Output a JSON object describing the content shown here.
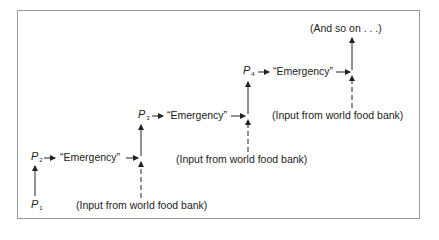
{
  "diagram": {
    "type": "stepwise-flow",
    "nodes": {
      "p1": {
        "base": "P",
        "sub": "1"
      },
      "p2": {
        "base": "P",
        "sub": "2"
      },
      "p3": {
        "base": "P",
        "sub": "3"
      },
      "p4": {
        "base": "P",
        "sub": "4"
      }
    },
    "steps": [
      {
        "emergency_label": "“Emergency”",
        "input_label": "(Input from world food bank)"
      },
      {
        "emergency_label": "“Emergency”",
        "input_label": "(Input from world food bank)"
      },
      {
        "emergency_label": "“Emergency”",
        "input_label": "(Input from world food bank)"
      }
    ],
    "continuation": "(And so on . . .)",
    "colors": {
      "line": "#222222",
      "border": "#9a9a9a",
      "background": "#ffffff"
    }
  }
}
